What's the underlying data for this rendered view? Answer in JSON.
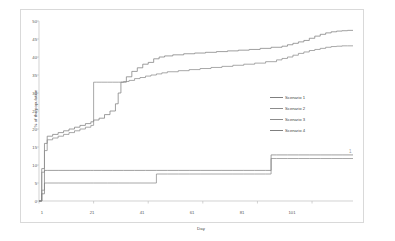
{
  "chart_data": {
    "type": "line",
    "title": "",
    "xlabel": "Day",
    "ylabel": "% of the population",
    "xlim": [
      1,
      116
    ],
    "ylim": [
      0,
      50
    ],
    "xticks": [
      1,
      21,
      41,
      61,
      81,
      101
    ],
    "yticks": [
      0,
      5,
      10,
      15,
      20,
      25,
      30,
      35,
      40,
      45,
      50
    ],
    "grid": false,
    "legend_position": "right",
    "line_style": "step",
    "series": [
      {
        "name": "Scenario 1",
        "color": "#7f7f7f",
        "x": [
          1,
          2,
          3,
          4,
          6,
          8,
          10,
          12,
          14,
          16,
          18,
          20,
          21,
          23,
          25,
          27,
          29,
          30,
          31,
          33,
          35,
          37,
          39,
          41,
          43,
          45,
          47,
          50,
          54,
          58,
          62,
          66,
          70,
          74,
          78,
          82,
          86,
          90,
          92,
          94,
          96,
          98,
          100,
          102,
          104,
          106,
          108,
          110,
          112,
          114,
          116
        ],
        "y": [
          0,
          9,
          16,
          18,
          18.5,
          19,
          19.5,
          20,
          20.5,
          21,
          21.5,
          22,
          22.5,
          23,
          24,
          25,
          27,
          30,
          33,
          34.5,
          36,
          37,
          38,
          38.5,
          39.5,
          40,
          40.3,
          40.6,
          40.9,
          41.1,
          41.3,
          41.5,
          41.7,
          41.9,
          42.1,
          42.4,
          42.7,
          43,
          43.4,
          43.8,
          44.2,
          44.6,
          45.2,
          45.8,
          46.3,
          46.7,
          47,
          47.2,
          47.3,
          47.4,
          47.4
        ]
      },
      {
        "name": "Scenario 2",
        "color": "#8c8c8c",
        "x": [
          1,
          2,
          3,
          4,
          6,
          8,
          10,
          12,
          14,
          16,
          18,
          20,
          21,
          22,
          24,
          26,
          28,
          30,
          32,
          34,
          36,
          38,
          40,
          42,
          44,
          46,
          48,
          52,
          56,
          60,
          64,
          68,
          72,
          76,
          80,
          84,
          88,
          90,
          92,
          94,
          96,
          98,
          100,
          102,
          104,
          106,
          108,
          110,
          112,
          114,
          116
        ],
        "y": [
          0,
          8,
          14,
          17,
          17.5,
          18,
          18.5,
          19,
          19.5,
          20,
          20.5,
          21,
          33,
          33,
          33,
          33,
          33,
          33,
          33.2,
          33.5,
          34,
          34.3,
          34.7,
          35,
          35.3,
          35.6,
          35.9,
          36.2,
          36.5,
          36.8,
          37.1,
          37.4,
          37.7,
          38,
          38.3,
          38.7,
          39.2,
          39.6,
          40,
          40.5,
          41,
          41.4,
          41.8,
          42.1,
          42.4,
          42.7,
          42.9,
          43,
          43.1,
          43.1,
          43.1
        ]
      },
      {
        "name": "Scenario 3",
        "color": "#8c8c8c",
        "x": [
          1,
          2,
          3,
          4,
          8,
          12,
          16,
          20,
          21,
          26,
          30,
          34,
          38,
          42,
          44,
          48,
          52,
          56,
          60,
          64,
          68,
          72,
          76,
          80,
          84,
          86,
          88,
          92,
          96,
          100,
          104,
          108,
          112,
          116
        ],
        "y": [
          0,
          3,
          5,
          5,
          5,
          5,
          5,
          5,
          5,
          5,
          5,
          5,
          5,
          5,
          7.5,
          7.5,
          7.5,
          7.5,
          7.5,
          7.5,
          7.5,
          7.5,
          7.5,
          7.5,
          7.5,
          11.8,
          11.8,
          11.8,
          11.8,
          11.8,
          11.8,
          11.8,
          11.8,
          11.8
        ]
      },
      {
        "name": "Scenario 4",
        "color": "#7f7f7f",
        "x": [
          1,
          2,
          3,
          4,
          8,
          12,
          16,
          20,
          21,
          24,
          28,
          32,
          36,
          40,
          44,
          48,
          52,
          56,
          60,
          64,
          68,
          72,
          76,
          80,
          84,
          86,
          88,
          92,
          96,
          100,
          104,
          108,
          112,
          116
        ],
        "y": [
          0,
          2,
          8.5,
          8.5,
          8.5,
          8.5,
          8.5,
          8.5,
          8.5,
          8.5,
          8.5,
          8.5,
          8.5,
          8.5,
          8.5,
          8.5,
          8.5,
          8.5,
          8.5,
          8.5,
          8.5,
          8.5,
          8.5,
          8.5,
          8.5,
          12.8,
          12.8,
          12.8,
          12.8,
          12.8,
          12.8,
          12.8,
          12.8,
          12.8
        ]
      }
    ]
  },
  "legend": {
    "items": [
      {
        "label": "Scenario 1"
      },
      {
        "label": "Scenario 2"
      },
      {
        "label": "Scenario 3"
      },
      {
        "label": "Scenario 4"
      }
    ]
  },
  "annotation": {
    "corner_mark": "1"
  },
  "colors": {
    "frame_border": "#d9d9d9",
    "axis_line": "#bfbfbf",
    "tick_text": "#595959",
    "title_text": "#3f3f3f",
    "background": "#ffffff"
  }
}
